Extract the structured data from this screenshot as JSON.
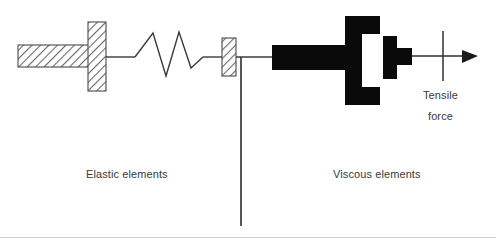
{
  "figure": {
    "background_color": "#ffffff",
    "line_color": "#3a3a3a",
    "solid_color": "#000000",
    "text_color": "#3a3a3a",
    "hatch_color": "#595959",
    "footer_rule_color": "#d2d2d2"
  },
  "labels": {
    "elastic": "Elastic elements",
    "viscous": "Viscous elements",
    "tensile_line1": "Tensile",
    "tensile_line2": "force"
  },
  "elements": {
    "wall_bar": "hatched-horizontal-bar",
    "wall_post": "hatched-vertical-post",
    "spring": "zigzag-spring",
    "connector_block": "hatched-small-block",
    "ground_line": "vertical-ground-line",
    "dashpot_cylinder": "filled-c-shaped-cylinder",
    "dashpot_piston": "filled-piston-plate",
    "force_arrow": "right-pointing-arrow",
    "force_tick": "vertical-tick-mark"
  }
}
